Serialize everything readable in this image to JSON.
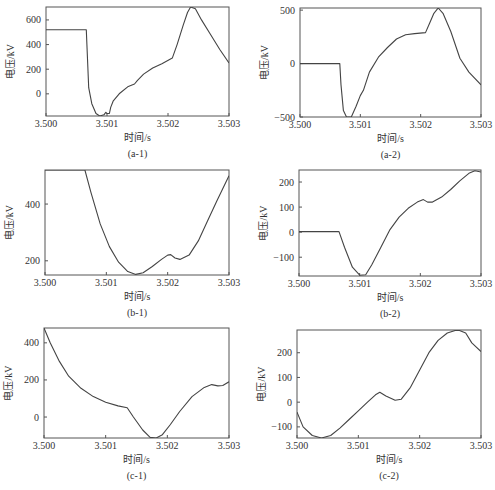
{
  "figure": {
    "ylabel": "电压/kV",
    "xlabel": "时间/s"
  },
  "chart_data": [
    {
      "id": "a-1",
      "caption": "(a-1)",
      "type": "line",
      "title": "",
      "xlabel": "时间/s",
      "ylabel": "电压/kV",
      "xlim": [
        3.5,
        3.503
      ],
      "ylim": [
        -180,
        705
      ],
      "xticks": [
        "3.500",
        "3.501",
        "3.502",
        "3.503"
      ],
      "yticks": [
        0,
        200,
        400,
        600
      ],
      "box": {
        "x": 46,
        "y": 7,
        "w": 183,
        "h": 109
      },
      "x": [
        3.5,
        3.50066,
        3.50067,
        3.5007,
        3.50075,
        3.50082,
        3.50088,
        3.50095,
        3.50098,
        3.501,
        3.50104,
        3.50106,
        3.5011,
        3.5012,
        3.50135,
        3.50145,
        3.5015,
        3.5016,
        3.50175,
        3.5019,
        3.50207,
        3.50215,
        3.50225,
        3.50232,
        3.50237,
        3.50245,
        3.50255,
        3.5027,
        3.50285,
        3.503
      ],
      "y": [
        520,
        520,
        400,
        50,
        -80,
        -160,
        -180,
        -170,
        -150,
        -160,
        -160,
        -110,
        -60,
        0,
        60,
        80,
        110,
        160,
        210,
        245,
        290,
        400,
        560,
        660,
        705,
        690,
        600,
        480,
        360,
        250
      ]
    },
    {
      "id": "a-2",
      "caption": "(a-2)",
      "type": "line",
      "title": "",
      "xlabel": "时间/s",
      "ylabel": "电压/kV",
      "xlim": [
        3.5,
        3.503
      ],
      "ylim": [
        -500,
        520
      ],
      "xticks": [
        "3.500",
        "3.501",
        "3.502",
        "3.503"
      ],
      "yticks": [
        -500,
        0,
        500
      ],
      "box": {
        "x": 300,
        "y": 8,
        "w": 181,
        "h": 109
      },
      "x": [
        3.5,
        3.50066,
        3.50068,
        3.50072,
        3.50077,
        3.50085,
        3.50093,
        3.501,
        3.50105,
        3.50115,
        3.5013,
        3.50145,
        3.5016,
        3.50175,
        3.5019,
        3.50208,
        3.50215,
        3.50222,
        3.50229,
        3.50237,
        3.5025,
        3.50265,
        3.5028,
        3.503
      ],
      "y": [
        0,
        0,
        -200,
        -440,
        -500,
        -500,
        -400,
        -300,
        -250,
        -80,
        60,
        150,
        230,
        270,
        280,
        290,
        380,
        470,
        520,
        470,
        300,
        50,
        -80,
        -200
      ]
    },
    {
      "id": "b-1",
      "caption": "(b-1)",
      "type": "line",
      "title": "",
      "xlabel": "时间/s",
      "ylabel": "电压/kV",
      "xlim": [
        3.5,
        3.503
      ],
      "ylim": [
        150,
        520
      ],
      "xticks": [
        "3.500",
        "3.501",
        "3.502",
        "3.503"
      ],
      "yticks": [
        200,
        400
      ],
      "box": {
        "x": 45,
        "y": 170,
        "w": 184,
        "h": 105
      },
      "x": [
        3.5,
        3.50065,
        3.50075,
        3.5009,
        3.50105,
        3.5012,
        3.50135,
        3.50148,
        3.5016,
        3.50175,
        3.5019,
        3.502,
        3.50205,
        3.50212,
        3.5022,
        3.50235,
        3.5025,
        3.50265,
        3.5028,
        3.503
      ],
      "y": [
        520,
        520,
        440,
        330,
        250,
        195,
        162,
        152,
        158,
        180,
        205,
        220,
        222,
        210,
        205,
        220,
        270,
        340,
        410,
        500
      ]
    },
    {
      "id": "b-2",
      "caption": "(b-2)",
      "type": "line",
      "title": "",
      "xlabel": "时间/s",
      "ylabel": "电压/kV",
      "xlim": [
        3.5,
        3.503
      ],
      "ylim": [
        -175,
        248
      ],
      "xticks": [
        "3.500",
        "3.501",
        "3.502",
        "3.503"
      ],
      "yticks": [
        -100,
        0,
        100,
        200
      ],
      "box": {
        "x": 299,
        "y": 170,
        "w": 182,
        "h": 106
      },
      "x": [
        3.5,
        3.50066,
        3.50075,
        3.50088,
        3.501,
        3.5011,
        3.5012,
        3.50135,
        3.5015,
        3.50165,
        3.5018,
        3.50195,
        3.50205,
        3.50212,
        3.5022,
        3.50235,
        3.5025,
        3.50265,
        3.5028,
        3.5029,
        3.503
      ],
      "y": [
        2,
        2,
        -60,
        -140,
        -172,
        -170,
        -130,
        -60,
        10,
        60,
        95,
        120,
        130,
        120,
        120,
        140,
        170,
        205,
        235,
        245,
        240
      ]
    },
    {
      "id": "c-1",
      "caption": "(c-1)",
      "type": "line",
      "title": "",
      "xlabel": "时间/s",
      "ylabel": "电压/kV",
      "xlim": [
        3.5,
        3.503
      ],
      "ylim": [
        -113,
        480
      ],
      "xticks": [
        "3.500",
        "3.501",
        "3.502",
        "3.503"
      ],
      "yticks": [
        0,
        200,
        400
      ],
      "box": {
        "x": 44,
        "y": 328,
        "w": 185,
        "h": 110
      },
      "x": [
        3.5,
        3.5001,
        3.50025,
        3.5004,
        3.5006,
        3.5008,
        3.501,
        3.5012,
        3.50135,
        3.50145,
        3.5016,
        3.50172,
        3.50182,
        3.50192,
        3.50205,
        3.5022,
        3.5024,
        3.5026,
        3.50272,
        3.50282,
        3.5029,
        3.503
      ],
      "y": [
        480,
        400,
        300,
        220,
        155,
        110,
        80,
        60,
        50,
        0,
        -70,
        -110,
        -113,
        -95,
        -40,
        30,
        110,
        160,
        175,
        168,
        170,
        190
      ]
    },
    {
      "id": "c-2",
      "caption": "(c-2)",
      "type": "line",
      "title": "",
      "xlabel": "时间/s",
      "ylabel": "电压/kV",
      "xlim": [
        3.5,
        3.503
      ],
      "ylim": [
        -145,
        292
      ],
      "xticks": [
        "3.500",
        "3.501",
        "3.502",
        "3.503"
      ],
      "yticks": [
        -100,
        0,
        100,
        200
      ],
      "box": {
        "x": 297,
        "y": 330,
        "w": 184,
        "h": 108
      },
      "x": [
        3.5,
        3.5001,
        3.50025,
        3.5004,
        3.50055,
        3.5007,
        3.50085,
        3.501,
        3.50115,
        3.50128,
        3.50135,
        3.50145,
        3.5016,
        3.5017,
        3.50185,
        3.502,
        3.50215,
        3.5023,
        3.50245,
        3.50258,
        3.50265,
        3.50275,
        3.50285,
        3.503
      ],
      "y": [
        -40,
        -100,
        -135,
        -145,
        -135,
        -105,
        -70,
        -35,
        0,
        30,
        40,
        25,
        8,
        12,
        60,
        130,
        200,
        250,
        280,
        290,
        290,
        280,
        240,
        205
      ]
    }
  ]
}
